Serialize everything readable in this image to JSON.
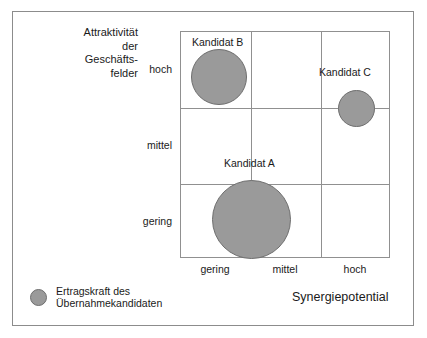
{
  "figure": {
    "background_color": "#ffffff",
    "frame_color": "#8c8c8c",
    "grid_color": "#909090",
    "bubble_fill": "#9a9a9a",
    "bubble_stroke": "#6e6e6e"
  },
  "axes": {
    "y_title": "Attraktivität\nder\nGeschäfts-\nfelder",
    "x_title": "Synergiepotential",
    "y_ticks": [
      "hoch",
      "mittel",
      "gering"
    ],
    "x_ticks": [
      "gering",
      "mittel",
      "hoch"
    ]
  },
  "legend": {
    "marker_name": "bubble-size-marker",
    "text": "Ertragskraft des\nÜbernahmekandidaten"
  },
  "bubbles": [
    {
      "label": "Kandidat B",
      "cx": 38,
      "cy": 45,
      "d": 56,
      "label_x": 11,
      "label_y": 4
    },
    {
      "label": "Kandidat C",
      "cx": 175,
      "cy": 76,
      "d": 37,
      "label_x": 138,
      "label_y": 34
    },
    {
      "label": "Kandidat A",
      "cx": 70,
      "cy": 187,
      "d": 79,
      "label_x": 43,
      "label_y": 125
    }
  ],
  "chart_data": {
    "type": "scatter",
    "title": "",
    "subtitle": "",
    "xlabel": "Synergiepotential",
    "ylabel": "Attraktivität der Geschäftsfelder",
    "x_tick_labels": [
      "gering",
      "mittel",
      "hoch"
    ],
    "y_tick_labels": [
      "hoch",
      "mittel",
      "gering"
    ],
    "xlim": [
      0,
      3
    ],
    "ylim": [
      0,
      3
    ],
    "grid": true,
    "legend_position": "bottom-left",
    "legend_entries": [
      "Ertragskraft des Übernahmekandidaten"
    ],
    "size_encodes": "Ertragskraft des Übernahmekandidaten",
    "points": [
      {
        "name": "Kandidat B",
        "x": "gering",
        "y": "hoch",
        "x_value": 0.54,
        "y_value": 2.41,
        "size_diameter_px": 56,
        "size_rank": "mittel"
      },
      {
        "name": "Kandidat C",
        "x": "hoch",
        "y": "hoch",
        "x_value": 2.5,
        "y_value": 2.0,
        "size_diameter_px": 37,
        "size_rank": "gering"
      },
      {
        "name": "Kandidat A",
        "x": "mittel",
        "y": "gering",
        "x_value": 1.0,
        "y_value": 0.53,
        "size_diameter_px": 79,
        "size_rank": "hoch"
      }
    ]
  }
}
